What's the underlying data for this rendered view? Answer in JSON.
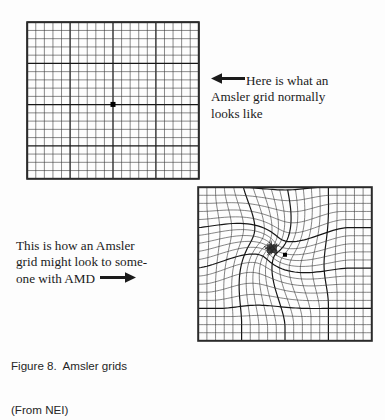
{
  "figure": {
    "caption_line1": "Figure 8.  Amsler grids",
    "caption_line2": "(From NEI)",
    "background_color": "#fdfdfd",
    "ink_color": "#1a1a1a"
  },
  "normal_grid": {
    "title": "Amsler grid normal",
    "columns": 20,
    "rows": 19,
    "major_every": 5,
    "line_color": "#3b3b3b",
    "major_line_color": "#161616",
    "border_color": "#2a2a2a",
    "fixation_dot": {
      "shape": "square",
      "size_px": 5,
      "color": "#000000",
      "center_x_frac": 0.5,
      "center_y_frac": 0.525
    }
  },
  "distorted_grid": {
    "title": "Amsler grid as seen with AMD",
    "columns": 20,
    "rows": 19,
    "major_every": 5,
    "line_color": "#3b3b3b",
    "major_line_color": "#161616",
    "border_color": "#2a2a2a",
    "distortion": {
      "type": "swirl-pinch",
      "center_x_frac": 0.425,
      "center_y_frac": 0.4,
      "radius_frac": 0.52,
      "pinch_strength": 0.72,
      "swirl_radians": 1.15,
      "scotoma_blob_color": "#1c1c1c"
    },
    "fixation_dot": {
      "shape": "square",
      "size_px": 4,
      "color": "#000000",
      "center_x_frac": 0.5,
      "center_y_frac": 0.44
    }
  },
  "normal_annotation": {
    "arrow_icon": "arrow-left-icon",
    "line1": "Here is what an",
    "line2": "Amsler grid normally",
    "line3": "looks like"
  },
  "amd_annotation": {
    "arrow_icon": "arrow-right-icon",
    "line1": "This is how an Amsler",
    "line2": "grid might look to some-",
    "line3": "one with AMD"
  }
}
